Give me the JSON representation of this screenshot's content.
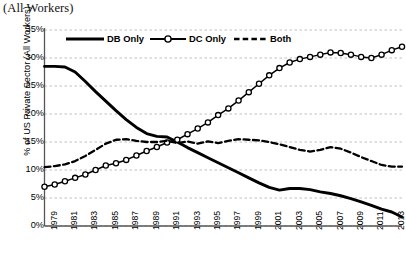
{
  "title_partial": "(All Workers)",
  "axes": {
    "ylabel": "% of US Private Sector (All Workers)",
    "yticks": [
      "0%",
      "5%",
      "10%",
      "15%",
      "20%",
      "25%",
      "30%",
      "35%"
    ],
    "xticks": [
      "1979",
      "1981",
      "1983",
      "1985",
      "1987",
      "1989",
      "1991",
      "1993",
      "1995",
      "1997",
      "1999",
      "2001",
      "2003",
      "2005",
      "2007",
      "2009",
      "2011",
      "2013"
    ]
  },
  "legend": {
    "items": [
      {
        "label": "DB Only",
        "style": "solid-thick"
      },
      {
        "label": "DC Only",
        "style": "line-with-circle-markers"
      },
      {
        "label": "Both",
        "style": "dashed"
      }
    ]
  },
  "colors": {
    "line": "#000000",
    "grid": "#b9b9b9",
    "axis": "#555555",
    "marker_fill": "#ffffff",
    "background": "#ffffff"
  },
  "chart_data": {
    "type": "line",
    "title": "(All Workers)",
    "xlabel": "",
    "ylabel": "% of US Private Sector (All Workers)",
    "xlim": [
      1979,
      2014
    ],
    "ylim": [
      0,
      35
    ],
    "ytick_step": 5,
    "grid": "horizontal-dashed",
    "legend_position": "top-inside",
    "x": [
      1979,
      1980,
      1981,
      1982,
      1983,
      1984,
      1985,
      1986,
      1987,
      1988,
      1989,
      1990,
      1991,
      1992,
      1993,
      1994,
      1995,
      1996,
      1997,
      1998,
      1999,
      2000,
      2001,
      2002,
      2003,
      2004,
      2005,
      2006,
      2007,
      2008,
      2009,
      2010,
      2011,
      2012,
      2013,
      2014
    ],
    "series": [
      {
        "name": "DB Only",
        "style": "solid-thick",
        "markers": false,
        "values": [
          28.5,
          28.5,
          28.4,
          27.5,
          25.8,
          24.0,
          22.3,
          20.6,
          19.0,
          17.6,
          16.5,
          16.0,
          15.9,
          15.0,
          14.0,
          13.1,
          12.2,
          11.3,
          10.4,
          9.5,
          8.6,
          7.7,
          6.9,
          6.4,
          6.7,
          6.7,
          6.5,
          6.1,
          5.8,
          5.4,
          4.9,
          4.3,
          3.7,
          3.0,
          2.5,
          1.6
        ]
      },
      {
        "name": "DC Only",
        "style": "line-with-circle-markers",
        "markers": true,
        "values": [
          7.0,
          7.4,
          8.0,
          8.6,
          9.2,
          10.0,
          10.8,
          11.2,
          11.8,
          12.6,
          13.4,
          14.1,
          14.9,
          15.4,
          16.4,
          17.4,
          18.5,
          19.8,
          21.0,
          22.4,
          23.9,
          25.4,
          26.9,
          28.2,
          29.2,
          29.8,
          30.2,
          30.6,
          31.0,
          30.9,
          30.6,
          30.2,
          30.0,
          30.6,
          31.4,
          32.0
        ]
      },
      {
        "name": "Both",
        "style": "dashed",
        "markers": false,
        "values": [
          10.5,
          10.7,
          11.0,
          11.6,
          12.5,
          13.6,
          14.7,
          15.4,
          15.5,
          15.2,
          15.0,
          15.0,
          15.2,
          14.8,
          15.1,
          14.7,
          15.1,
          14.8,
          15.2,
          15.5,
          15.4,
          15.3,
          15.0,
          14.6,
          14.1,
          13.6,
          13.3,
          13.6,
          14.1,
          13.8,
          13.1,
          12.3,
          11.6,
          10.9,
          10.6,
          10.6
        ]
      }
    ]
  }
}
